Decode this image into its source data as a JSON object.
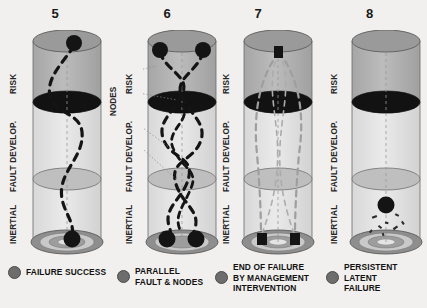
{
  "figure": {
    "background_color": "#f2f0ee",
    "ink_color": "#1a1a1a"
  },
  "zone_labels": {
    "risk": "RISK",
    "fault_develop": "FAULT DEVELOP.",
    "inertial": "INERTIAL"
  },
  "annotations": {
    "nodes": "NODES"
  },
  "panels": [
    {
      "number": "5",
      "legend": "FAILURE SUCCESS",
      "legend_dot_color": "#6d6d6d",
      "has_nodes_annotation": false,
      "marker_shape": "circle",
      "top_markers": 1,
      "bottom_markers": 1,
      "trajectory": "single-sinuous",
      "fragments": false
    },
    {
      "number": "6",
      "legend": "PARALLEL\nFAULT & NODES",
      "legend_dot_color": "#6d6d6d",
      "has_nodes_annotation": true,
      "marker_shape": "circle",
      "top_markers": 2,
      "bottom_markers": 2,
      "trajectory": "multi-braided",
      "fragments": false
    },
    {
      "number": "7",
      "legend": "END OF FAILURE\nBY MANAGEMENT\nINTERVENTION",
      "legend_dot_color": "#6d6d6d",
      "has_nodes_annotation": false,
      "marker_shape": "square",
      "top_markers": 1,
      "bottom_markers": 2,
      "trajectory": "split-pair",
      "fragments": false
    },
    {
      "number": "8",
      "legend": "PERSISTENT\nLATENT\nFAILURE",
      "legend_dot_color": "#6d6d6d",
      "has_nodes_annotation": false,
      "marker_shape": "circle",
      "top_markers": 0,
      "bottom_markers": 1,
      "trajectory": "none",
      "fragments": true
    }
  ],
  "cylinder": {
    "top_cap_color": "#9a9a9a",
    "risk_band_color": "#b4b4b4",
    "mid_band_color": "#dcdcdc",
    "lower_band_color": "#e2e2e2",
    "black_disc_color": "#121212",
    "mid_disc_color": "#bdbdbd",
    "base_ring_colors": [
      "#8e8e8e",
      "#cfcfcf",
      "#a5a5a5",
      "#e6e6e6"
    ],
    "outline_color": "#555555",
    "axis_dash_color": "#9b9b9b",
    "trajectory_color": "#141414"
  }
}
